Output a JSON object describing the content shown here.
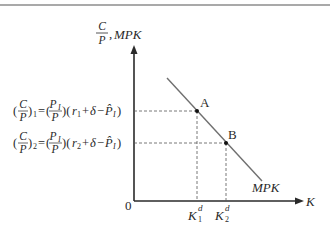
{
  "diagram": {
    "type": "economics-investment-demand",
    "y_axis": {
      "label_numerator": "C",
      "label_denominator": "P",
      "label_separator": ",",
      "label_suffix": "MPK"
    },
    "x_axis": {
      "label": "K",
      "origin_label": "0"
    },
    "curve": {
      "label": "MPK"
    },
    "points": [
      {
        "label": "A",
        "x_label_base": "K",
        "x_label_sup": "d",
        "x_label_sub": "1"
      },
      {
        "label": "B",
        "x_label_base": "K",
        "x_label_sup": "d",
        "x_label_sub": "2"
      }
    ],
    "equations": [
      {
        "lhs_num": "C",
        "lhs_den": "P",
        "lhs_sub": "1",
        "rhs_num": "P",
        "rhs_num_sub": "I",
        "rhs_den": "P",
        "r": "r",
        "r_sub": "1",
        "delta": "δ",
        "phat": "P̂",
        "phat_sub": "I"
      },
      {
        "lhs_num": "C",
        "lhs_den": "P",
        "lhs_sub": "2",
        "rhs_num": "P",
        "rhs_num_sub": "I",
        "rhs_den": "P",
        "r": "r",
        "r_sub": "2",
        "delta": "δ",
        "phat": "P̂",
        "phat_sub": "I"
      }
    ],
    "colors": {
      "axis": "#2a2a2a",
      "curve": "#6f6f6f",
      "guide": "#555555",
      "top_rule": "#8c8c8c"
    }
  }
}
